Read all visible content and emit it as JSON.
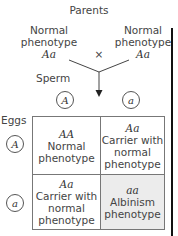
{
  "title": "Parents",
  "parents": [
    {
      "phenotype_line1": "Normal",
      "phenotype_line2": "phenotype",
      "genotype": "Aa"
    },
    {
      "phenotype_line1": "Normal",
      "phenotype_line2": "phenotype",
      "genotype": "Aa"
    }
  ],
  "cross_symbol": "×",
  "sperm_label": "Sperm",
  "eggs_label": "Eggs",
  "sperm_alleles": [
    "A",
    "a"
  ],
  "egg_alleles": [
    "A",
    "a"
  ],
  "punnett": {
    "cells": [
      {
        "genotype": "AA",
        "lines": [
          "Normal",
          "phenotype",
          ""
        ]
      },
      {
        "genotype": "Aa",
        "lines": [
          "Carrier with",
          "normal",
          "phenotype"
        ]
      },
      {
        "genotype": "Aa",
        "lines": [
          "Carrier with",
          "normal",
          "phenotype"
        ]
      },
      {
        "genotype": "aa",
        "lines": [
          "Albinism",
          "phenotype",
          ""
        ]
      }
    ],
    "highlight_color": "#ececec"
  }
}
